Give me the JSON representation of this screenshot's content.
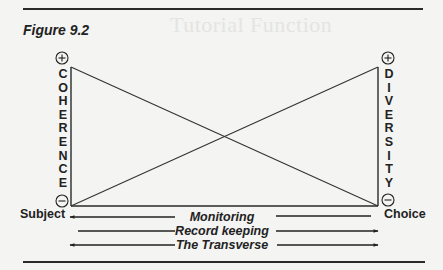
{
  "figure": {
    "title": "Figure 9.2",
    "bleed_through_text": "Tutorial Function"
  },
  "left_axis": {
    "label_letters": [
      "C",
      "O",
      "H",
      "E",
      "R",
      "E",
      "N",
      "C",
      "E"
    ],
    "top_symbol": "+",
    "bottom_symbol": "−",
    "pole_label": "Subject"
  },
  "right_axis": {
    "label_letters": [
      "D",
      "I",
      "V",
      "E",
      "R",
      "S",
      "I",
      "T",
      "Y"
    ],
    "top_symbol": "+",
    "bottom_symbol": "−",
    "pole_label": "Choice"
  },
  "arrows": [
    {
      "label": "Monitoring",
      "direction": "left"
    },
    {
      "label": "Record keeping",
      "direction": "right"
    },
    {
      "label": "The Transverse",
      "direction": "both"
    }
  ],
  "colors": {
    "ink": "#222222",
    "paper": "#f4f4f2"
  }
}
